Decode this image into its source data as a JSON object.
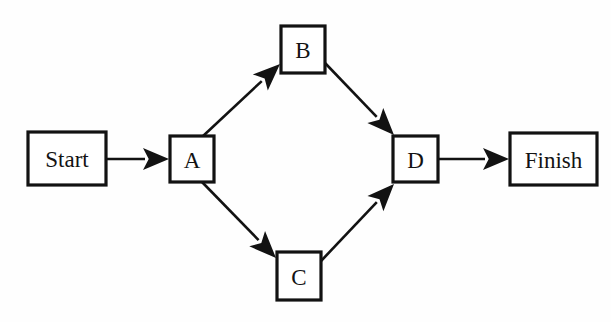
{
  "diagram": {
    "type": "flowchart",
    "canvas": {
      "width": 611,
      "height": 322
    },
    "style": {
      "background_color": "#fefefe",
      "node_fill": "#ffffff",
      "stroke_color": "#121212",
      "node_stroke_width": 3.2,
      "edge_stroke_width": 2.6
    },
    "nodes": [
      {
        "id": "start",
        "label": "Start",
        "shape": "rectangle",
        "x": 28,
        "y": 132,
        "width": 78,
        "height": 53,
        "font_size": 23
      },
      {
        "id": "a",
        "label": "A",
        "shape": "rectangle",
        "x": 170,
        "y": 136,
        "width": 44,
        "height": 46,
        "font_size": 23
      },
      {
        "id": "b",
        "label": "B",
        "shape": "rectangle",
        "x": 281,
        "y": 26,
        "width": 44,
        "height": 47,
        "font_size": 23
      },
      {
        "id": "c",
        "label": "C",
        "shape": "rectangle",
        "x": 277,
        "y": 252,
        "width": 44,
        "height": 48,
        "font_size": 23
      },
      {
        "id": "d",
        "label": "D",
        "shape": "rectangle",
        "x": 393,
        "y": 136,
        "width": 45,
        "height": 46,
        "font_size": 23
      },
      {
        "id": "finish",
        "label": "Finish",
        "shape": "rectangle",
        "x": 510,
        "y": 133,
        "width": 87,
        "height": 52,
        "font_size": 23
      }
    ],
    "edges": [
      {
        "id": "start-to-a",
        "from": "start",
        "to": "a",
        "label": "",
        "direction": "right",
        "x1": 106,
        "y1": 159,
        "x2": 169,
        "y2": 159,
        "arrow_length": 26,
        "arrow_width": 22
      },
      {
        "id": "a-to-b",
        "from": "a",
        "to": "b",
        "label": "",
        "direction": "up-right",
        "x1": 202,
        "y1": 137,
        "x2": 280,
        "y2": 64,
        "arrow_length": 27,
        "arrow_width": 22
      },
      {
        "id": "a-to-c",
        "from": "a",
        "to": "c",
        "label": "",
        "direction": "down-right",
        "x1": 202,
        "y1": 182,
        "x2": 276,
        "y2": 258,
        "arrow_length": 27,
        "arrow_width": 22
      },
      {
        "id": "b-to-d",
        "from": "b",
        "to": "d",
        "label": "",
        "direction": "down-right",
        "x1": 325,
        "y1": 63,
        "x2": 394,
        "y2": 135,
        "arrow_length": 27,
        "arrow_width": 22
      },
      {
        "id": "c-to-d",
        "from": "c",
        "to": "d",
        "label": "",
        "direction": "up-right",
        "x1": 321,
        "y1": 261,
        "x2": 394,
        "y2": 184,
        "arrow_length": 27,
        "arrow_width": 22
      },
      {
        "id": "d-to-finish",
        "from": "d",
        "to": "finish",
        "label": "",
        "direction": "right",
        "x1": 438,
        "y1": 159,
        "x2": 509,
        "y2": 159,
        "arrow_length": 26,
        "arrow_width": 22
      }
    ]
  }
}
